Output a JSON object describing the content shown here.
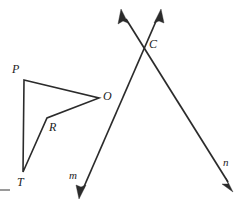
{
  "figure": {
    "type": "geometry-diagram",
    "width": 245,
    "height": 215,
    "background_color": "#ffffff",
    "stroke_color": "#2b2b2b"
  },
  "polygon": {
    "name": "quadrilateral-PORT",
    "vertex_order": [
      "P",
      "O",
      "R",
      "T"
    ],
    "closed": true,
    "vertices": [
      {
        "label": "P",
        "x": 24,
        "y": 80,
        "label_x": 12,
        "label_y": 63
      },
      {
        "label": "O",
        "x": 99,
        "y": 98,
        "label_x": 103,
        "label_y": 90
      },
      {
        "label": "R",
        "x": 47,
        "y": 118,
        "label_x": 49,
        "label_y": 121
      },
      {
        "label": "T",
        "x": 23,
        "y": 172,
        "label_x": 17,
        "label_y": 176
      }
    ],
    "edges": [
      {
        "from": "P",
        "to": "O"
      },
      {
        "from": "O",
        "to": "R"
      },
      {
        "from": "R",
        "to": "T"
      },
      {
        "from": "T",
        "to": "P"
      }
    ]
  },
  "lines": [
    {
      "label": "m",
      "label_x": 69,
      "label_y": 170,
      "description": "line through C from upper-right to lower-left",
      "x1": 160,
      "y1": 12,
      "x2": 80,
      "y2": 196,
      "arrow_start": true,
      "arrow_end": true
    },
    {
      "label": "n",
      "label_x": 223,
      "label_y": 157,
      "description": "line through C from upper-left to lower-right",
      "x1": 122,
      "y1": 12,
      "x2": 232,
      "y2": 188,
      "arrow_start": true,
      "arrow_end": true
    }
  ],
  "intersection": {
    "label": "C",
    "x": 146,
    "y": 44,
    "label_x": 149,
    "label_y": 38,
    "of_lines": [
      "m",
      "n"
    ]
  },
  "marks": {
    "crop_dash": {
      "x": 0,
      "y": 189,
      "width": 10,
      "height": 2,
      "color": "#9a9a9a"
    }
  }
}
